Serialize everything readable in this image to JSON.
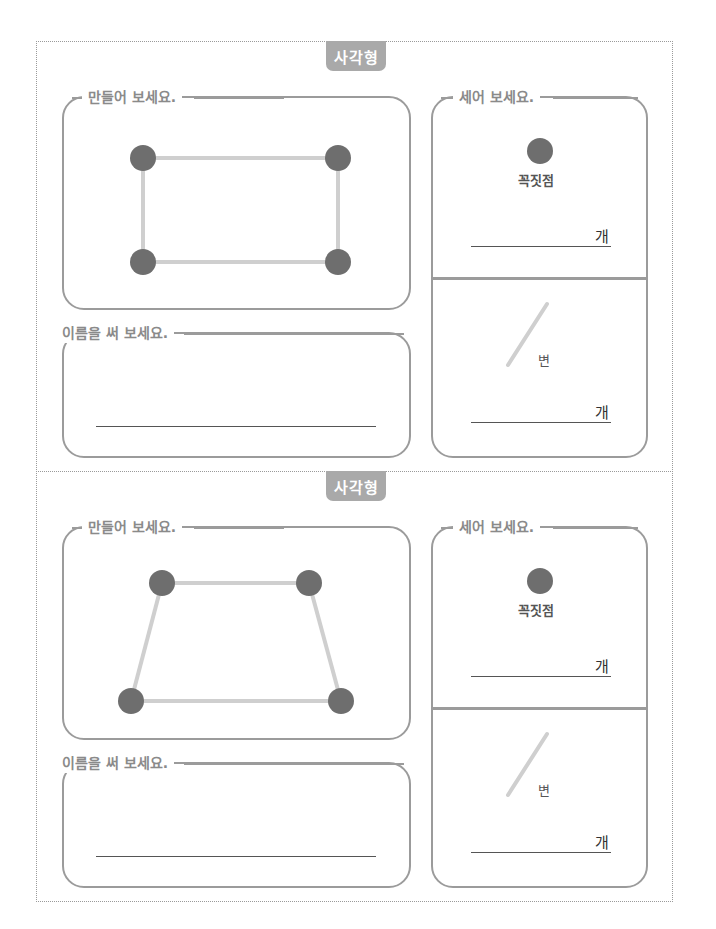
{
  "cards": [
    {
      "tab_label": "사각형",
      "make_label": "만들어 보세요.",
      "name_label": "이름을 써 보세요.",
      "count_label": "세어 보세요.",
      "vertex_caption": "꼭짓점",
      "edge_caption": "변",
      "unit_vertex": "개",
      "unit_edge": "개",
      "shape": "rectangle",
      "vertex_count": 4,
      "colors": {
        "vertex": "#6e6e6e",
        "edge": "#cfcfcf"
      }
    },
    {
      "tab_label": "사각형",
      "make_label": "만들어 보세요.",
      "name_label": "이름을 써 보세요.",
      "count_label": "세어 보세요.",
      "vertex_caption": "꼭짓점",
      "edge_caption": "변",
      "unit_vertex": "개",
      "unit_edge": "개",
      "shape": "trapezoid",
      "vertex_count": 4,
      "colors": {
        "vertex": "#6e6e6e",
        "edge": "#cfcfcf"
      }
    }
  ]
}
